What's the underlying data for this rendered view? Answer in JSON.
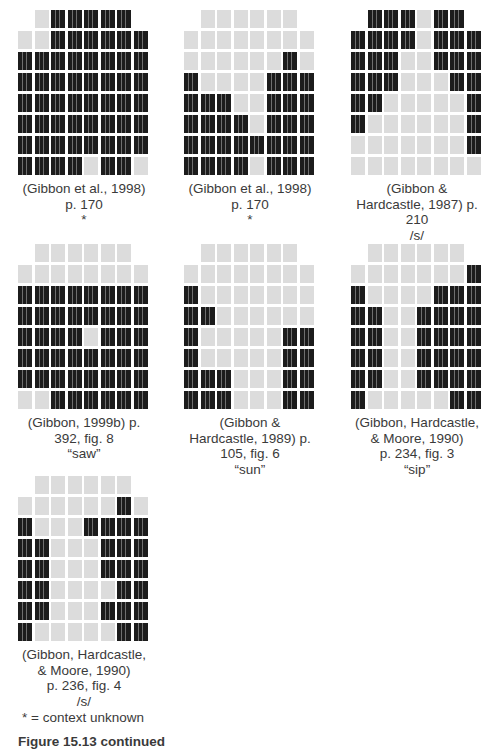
{
  "colors": {
    "contact": "#1c1c1c",
    "no_contact": "#dcdcdc"
  },
  "palatograms": [
    {
      "caption": [
        "(Gibbon et al., 1998)",
        "p. 170",
        "*"
      ],
      "rows": [
        "011111",
        "00111111",
        "11111111",
        "11111111",
        "11111111",
        "11111111",
        "11111111",
        "11110110"
      ]
    },
    {
      "caption": [
        "(Gibbon et al., 1998)",
        "p. 170",
        "*"
      ],
      "rows": [
        "000000",
        "00000000",
        "00000010",
        "10000111",
        "11100111",
        "11110111",
        "11111111",
        "11110111"
      ]
    },
    {
      "caption": [
        "(Gibbon &",
        "Hardcastle, 1987) p.",
        "210",
        "/s/"
      ],
      "rows": [
        "111011",
        "11110111",
        "11100111",
        "11100011",
        "11000001",
        "10000001",
        "00000001",
        "00000000"
      ]
    },
    {
      "caption": [
        "(Gibbon, 1999b) p.",
        "392, fig. 8",
        "“saw”"
      ],
      "rows": [
        "000000",
        "00000000",
        "11111111",
        "11111111",
        "11110111",
        "11111111",
        "11111111",
        "00111111"
      ]
    },
    {
      "caption": [
        "(Gibbon &",
        "Hardcastle, 1989) p.",
        "105, fig. 6",
        "“sun”"
      ],
      "rows": [
        "000000",
        "00000000",
        "10000000",
        "11000000",
        "10000011",
        "10000011",
        "11100011",
        "11100011"
      ]
    },
    {
      "caption": [
        "(Gibbon, Hardcastle,",
        "& Moore, 1990)",
        "p. 234, fig. 3",
        "“sip”"
      ],
      "rows": [
        "000000",
        "00000001",
        "10000111",
        "11001111",
        "11001111",
        "11001111",
        "11001111",
        "10000011"
      ]
    },
    {
      "caption": [
        "(Gibbon, Hardcastle,",
        "& Moore, 1990)",
        "p. 236, fig. 4",
        "/s/"
      ],
      "rows": [
        "000000",
        "00000010",
        "10001111",
        "11000111",
        "11000111",
        "11000011",
        "11000111",
        "10000011"
      ]
    }
  ],
  "legend": "* = context unknown",
  "figure_title": "Figure 15.13 continued"
}
